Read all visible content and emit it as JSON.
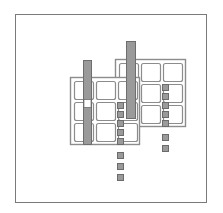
{
  "figure": {
    "canvas": {
      "width": 223,
      "height": 213,
      "background": "#ffffff"
    },
    "palette": {
      "outline": "#7a7a7a",
      "cell_stroke": "#8c8c8c",
      "bar_fill": "#9a9a9a",
      "bar_stroke": "#6e6e6e",
      "small_fill": "#9a9a9a",
      "small_stroke": "#6b6b6b",
      "background": "#ffffff"
    },
    "outer_frame": {
      "x": 15,
      "y": 14,
      "width": 192,
      "height": 189,
      "stroke": "#7a7a7a",
      "stroke_width": 1
    },
    "containers": [
      {
        "id": "left-grid-container",
        "x": 70,
        "y": 77,
        "width": 70,
        "height": 68,
        "stroke": "#8c8c8c",
        "stroke_width": 1.4
      },
      {
        "id": "right-grid-container",
        "x": 115,
        "y": 59,
        "width": 71,
        "height": 68,
        "stroke": "#8c8c8c",
        "stroke_width": 1.4
      }
    ],
    "left_grid": {
      "cols": 3,
      "rows": 3,
      "cell_width": 19,
      "cell_height": 18,
      "gap_x": 3,
      "gap_y": 3,
      "origin_x": 74,
      "origin_y": 81,
      "corner_radius": 2
    },
    "right_grid": {
      "cols": 3,
      "rows": 3,
      "cell_width": 19,
      "cell_height": 18,
      "gap_x": 3,
      "gap_y": 3,
      "origin_x": 119,
      "origin_y": 63,
      "corner_radius": 2
    },
    "bars": [
      {
        "id": "left-vertical-bar",
        "x": 83,
        "y": 60,
        "width": 9,
        "height": 85,
        "fill": "#9a9a9a",
        "stroke": "#6e6e6e",
        "gap": {
          "y": 99,
          "height": 9,
          "fill": "#ffffff"
        }
      },
      {
        "id": "right-vertical-bar",
        "x": 126,
        "y": 41,
        "width": 10,
        "height": 78,
        "fill": "#9a9a9a",
        "stroke": "#6e6e6e",
        "gap": null
      }
    ],
    "small_square_columns": [
      {
        "id": "center-small-column",
        "x": 117,
        "size": 6,
        "fill": "#9a9a9a",
        "stroke": "#6b6b6b",
        "y_positions": [
          102,
          111,
          120,
          129,
          138,
          152,
          163,
          174
        ]
      },
      {
        "id": "right-small-column",
        "x": 162,
        "size": 6,
        "fill": "#9a9a9a",
        "stroke": "#6b6b6b",
        "y_positions": [
          84,
          93,
          102,
          111,
          120,
          134,
          145
        ]
      }
    ]
  }
}
